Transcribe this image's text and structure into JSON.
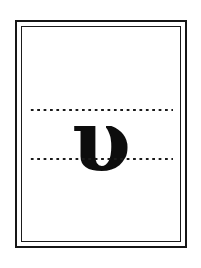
{
  "page": {
    "background_color": "#ffffff",
    "width": 201,
    "height": 268
  },
  "frame": {
    "style": "double-rule",
    "outer_color": "#161616",
    "inner_color": "#1b1b1b",
    "outer_thickness_px": 2,
    "inner_thickness_px": 1
  },
  "guides": {
    "style": "dotted",
    "color": "#1a1a1a",
    "count": 2,
    "top_label": "x-height-guide-line",
    "bottom_label": "baseline-guide-line"
  },
  "glyph": {
    "character": "υ",
    "name": "greek-small-letter-upsilon",
    "script": "Greek",
    "case": "lowercase",
    "color": "#0d0d0d"
  }
}
